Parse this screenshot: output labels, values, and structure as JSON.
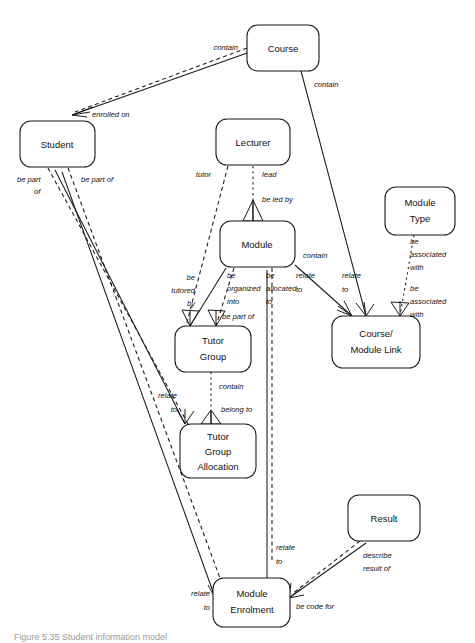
{
  "diagram": {
    "type": "entity-relationship-diagram",
    "title": "Student information model",
    "entities": [
      {
        "id": "course",
        "label": "Course",
        "lines": [
          "Course"
        ],
        "x": 247,
        "y": 25,
        "w": 72,
        "h": 46
      },
      {
        "id": "student",
        "label": "Student",
        "lines": [
          "Student"
        ],
        "x": 20,
        "y": 121,
        "w": 75,
        "h": 46
      },
      {
        "id": "lecturer",
        "label": "Lecturer",
        "lines": [
          "Lecturer"
        ],
        "x": 216,
        "y": 119,
        "w": 74,
        "h": 46
      },
      {
        "id": "module",
        "label": "Module",
        "lines": [
          "Module"
        ],
        "x": 220,
        "y": 221,
        "w": 75,
        "h": 46
      },
      {
        "id": "module_type",
        "label": "Module Type",
        "lines": [
          "Module",
          "Type"
        ],
        "x": 385,
        "y": 187,
        "w": 70,
        "h": 48
      },
      {
        "id": "cm_link",
        "label": "Course/Module Link",
        "lines": [
          "Course/",
          "Module Link"
        ],
        "x": 332,
        "y": 316,
        "w": 88,
        "h": 52
      },
      {
        "id": "tutor_group",
        "label": "Tutor Group",
        "lines": [
          "Tutor",
          "Group"
        ],
        "x": 175,
        "y": 326,
        "w": 76,
        "h": 46
      },
      {
        "id": "tg_alloc",
        "label": "Tutor Group Allocation",
        "lines": [
          "Tutor",
          "Group",
          "Allocation"
        ],
        "x": 180,
        "y": 424,
        "w": 76,
        "h": 54
      },
      {
        "id": "result",
        "label": "Result",
        "lines": [
          "Result"
        ],
        "x": 348,
        "y": 495,
        "w": 72,
        "h": 46
      },
      {
        "id": "mod_enrol",
        "label": "Module Enrolment",
        "lines": [
          "Module",
          "Enrolment"
        ],
        "x": 213,
        "y": 578,
        "w": 77,
        "h": 49
      }
    ],
    "relationships": [
      {
        "id": "course-contain-student",
        "label": "contain",
        "from": "course",
        "to": "student",
        "style": "dashed"
      },
      {
        "id": "student-enrolled-on",
        "label": "enrolled on",
        "from": "student",
        "to": "course",
        "style": "solid"
      },
      {
        "id": "course-contain-cmlink",
        "label": "contain",
        "from": "course",
        "to": "cm_link",
        "style": "solid"
      },
      {
        "id": "student-be-part-of-1",
        "label": "be part of",
        "from": "student",
        "to": "tg_alloc",
        "style": "dashed"
      },
      {
        "id": "student-be-part-of-2",
        "label": "be part of",
        "from": "student",
        "to": "mod_enrol",
        "style": "dashed"
      },
      {
        "id": "lecturer-tutor",
        "label": "tutor",
        "from": "lecturer",
        "to": "tutor_group",
        "style": "dashed"
      },
      {
        "id": "lecturer-lead",
        "label": "lead",
        "from": "lecturer",
        "to": "module",
        "style": "dotted"
      },
      {
        "id": "module-be-led-by",
        "label": "be led by",
        "from": "module",
        "to": "lecturer",
        "style": "solid"
      },
      {
        "id": "module-be-tutored-by",
        "label": "be tutored by",
        "from": "module",
        "to": "tutor_group",
        "style": "solid"
      },
      {
        "id": "module-be-organized-into",
        "label": "be organized into",
        "from": "module",
        "to": "tutor_group",
        "style": "dashed"
      },
      {
        "id": "module-be-allocated-to",
        "label": "be allocated to",
        "from": "module",
        "to": "mod_enrol",
        "style": "dashed"
      },
      {
        "id": "tutorgroup-be-part-of",
        "label": "be part of",
        "from": "tutor_group",
        "to": "module",
        "style": "solid"
      },
      {
        "id": "module-contain-cmlink",
        "label": "contain",
        "from": "module",
        "to": "cm_link",
        "style": "solid"
      },
      {
        "id": "cmlink-relate-to-1",
        "label": "relate to",
        "from": "cm_link",
        "to": "module",
        "style": "solid"
      },
      {
        "id": "cmlink-relate-to-2",
        "label": "relate to",
        "from": "cm_link",
        "to": "course",
        "style": "solid"
      },
      {
        "id": "modtype-be-assoc-with",
        "label": "be associated with",
        "from": "module_type",
        "to": "cm_link",
        "style": "dotted"
      },
      {
        "id": "cmlink-be-assoc-with",
        "label": "be associated with",
        "from": "cm_link",
        "to": "module_type",
        "style": "solid"
      },
      {
        "id": "tutorgroup-contain",
        "label": "contain",
        "from": "tutor_group",
        "to": "tg_alloc",
        "style": "dotted"
      },
      {
        "id": "tgalloc-belong-to",
        "label": "belong to",
        "from": "tg_alloc",
        "to": "tutor_group",
        "style": "solid"
      },
      {
        "id": "tgalloc-relate-to",
        "label": "relate to",
        "from": "tg_alloc",
        "to": "student",
        "style": "solid"
      },
      {
        "id": "modenrol-relate-to-mod",
        "label": "relate to",
        "from": "mod_enrol",
        "to": "module",
        "style": "solid"
      },
      {
        "id": "modenrol-relate-to-stu",
        "label": "relate to",
        "from": "mod_enrol",
        "to": "student",
        "style": "solid"
      },
      {
        "id": "result-describe-result-of",
        "label": "describe result of",
        "from": "result",
        "to": "mod_enrol",
        "style": "dashed"
      },
      {
        "id": "modenrol-be-code-for",
        "label": "be code for",
        "from": "mod_enrol",
        "to": "result",
        "style": "solid"
      }
    ],
    "labels": {
      "contain_course_student": "contain",
      "enrolled_on": "enrolled on",
      "contain_course_cmlink": "contain",
      "be_part_line1": "be part",
      "be_part_line2": "of",
      "be_part_of": "be part of",
      "tutor": "tutor",
      "lead": "lead",
      "be_led_by": "be led by",
      "be_tutored_l1": "be",
      "be_tutored_l2": "tutored",
      "be_tutored_l3": "by",
      "be_organized_l1": "be",
      "be_organized_l2": "organized",
      "be_organized_l3": "into",
      "be_allocated_l1": "be",
      "be_allocated_l2": "allocated",
      "be_allocated_l3": "to",
      "be_part_of_module": "be part of",
      "contain_module_cmlink": "contain",
      "relate_to_l1": "relate",
      "relate_to_l2": "to",
      "relate_to2_l1": "relate",
      "relate_to2_l2": "to",
      "be_assoc_top_l1": "be",
      "be_assoc_top_l2": "associated",
      "be_assoc_top_l3": "with",
      "be_assoc_bot_l1": "be",
      "be_assoc_bot_l2": "associated",
      "be_assoc_bot_l3": "with",
      "contain_tg_tga": "contain",
      "belong_to": "belong to",
      "relate_to_tga_l1": "relate",
      "relate_to_tga_l2": "to",
      "relate_to_me_l1": "relate",
      "relate_to_me_l2": "to",
      "relate_to_me2_l1": "relate",
      "relate_to_me2_l2": "to",
      "describe_l1": "describe",
      "describe_l2": "result of",
      "be_code_for": "be code for"
    },
    "caption": "Figure 5.35   Student information model",
    "colors": {
      "stroke": "#1a1a1a",
      "text": "#111111",
      "background": "#ffffff",
      "caption": "#9a9a9a"
    }
  }
}
